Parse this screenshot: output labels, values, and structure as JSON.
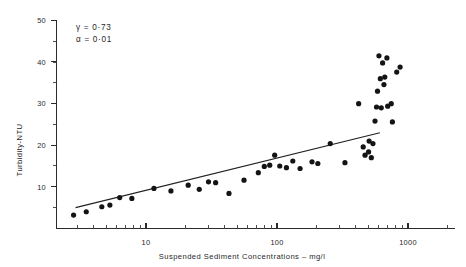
{
  "chart_data": {
    "type": "scatter",
    "title": "",
    "xlabel": "Suspended Sediment Concentrations – mg/l",
    "ylabel": "Turbidity-NTU",
    "xscale": "log",
    "yscale": "linear",
    "xlim": [
      2,
      1400
    ],
    "ylim": [
      0,
      50
    ],
    "grid": false,
    "legend": null,
    "xticks_major": [
      10,
      100,
      1000
    ],
    "xtick_labels": [
      "10",
      "100",
      "1000"
    ],
    "yticks_major": [
      10,
      20,
      30,
      40,
      50
    ],
    "ytick_labels": [
      "10",
      "20",
      "30",
      "40",
      "50"
    ],
    "yticks_minor": [
      5,
      15,
      25,
      35,
      45
    ],
    "annotations": [
      {
        "name": "gamma",
        "text": "γ  =  0·0·73",
        "label": "γ",
        "operator": "=",
        "value": "0·73"
      },
      {
        "name": "alpha",
        "text": "α  =  0·01",
        "label": "α",
        "operator": "=",
        "value": "0·01"
      }
    ],
    "annotation_lines": [
      "γ  =  0·73",
      "α  =  0·01"
    ],
    "series": [
      {
        "name": "observations",
        "marker": "filled-circle",
        "color": "#141414",
        "points": [
          [
            2.8,
            3.2
          ],
          [
            3.5,
            4.0
          ],
          [
            4.6,
            5.2
          ],
          [
            5.3,
            5.6
          ],
          [
            6.3,
            7.4
          ],
          [
            7.8,
            7.2
          ],
          [
            11.5,
            9.6
          ],
          [
            15.5,
            9.0
          ],
          [
            21.0,
            10.4
          ],
          [
            25.5,
            9.4
          ],
          [
            30.0,
            11.2
          ],
          [
            34.0,
            11.0
          ],
          [
            43.0,
            8.4
          ],
          [
            56.0,
            11.6
          ],
          [
            72.0,
            13.4
          ],
          [
            80.0,
            14.9
          ],
          [
            88.0,
            15.2
          ],
          [
            96.0,
            17.6
          ],
          [
            105.0,
            15.0
          ],
          [
            118.0,
            14.6
          ],
          [
            132.0,
            16.2
          ],
          [
            150.0,
            14.4
          ],
          [
            185.0,
            16.0
          ],
          [
            205.0,
            15.6
          ],
          [
            255.0,
            20.4
          ],
          [
            330.0,
            15.8
          ],
          [
            420.0,
            30.0
          ],
          [
            455.0,
            19.6
          ],
          [
            470.0,
            17.6
          ],
          [
            500.0,
            18.4
          ],
          [
            505.0,
            21.0
          ],
          [
            525.0,
            17.0
          ],
          [
            540.0,
            20.4
          ],
          [
            560.0,
            25.8
          ],
          [
            575.0,
            29.2
          ],
          [
            585.0,
            33.0
          ],
          [
            600.0,
            41.5
          ],
          [
            615.0,
            36.0
          ],
          [
            625.0,
            29.0
          ],
          [
            640.0,
            39.8
          ],
          [
            655.0,
            34.6
          ],
          [
            665.0,
            36.4
          ],
          [
            690.0,
            41.0
          ],
          [
            700.0,
            29.4
          ],
          [
            745.0,
            30.0
          ],
          [
            760.0,
            25.6
          ],
          [
            820.0,
            37.6
          ],
          [
            870.0,
            38.8
          ]
        ]
      }
    ],
    "fit_line": {
      "name": "regression-line",
      "x_start": 2.9,
      "y_start": 5.0,
      "x_end": 610.0,
      "y_end": 23.0,
      "color": "#202020"
    }
  }
}
